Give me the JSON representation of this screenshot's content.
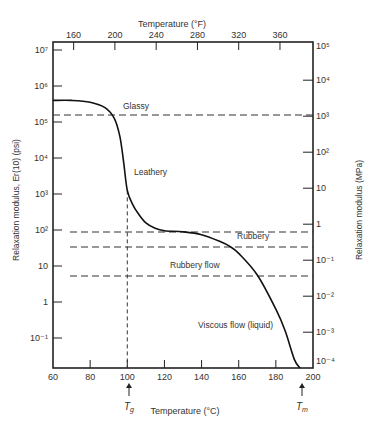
{
  "chart_data": {
    "type": "line",
    "title": "",
    "xlabel": "Temperature (°C)",
    "x2label": "Temperature (°F)",
    "ylabel": "Relaxation modulus, Er(10) (psi)",
    "y2label": "Relaxation modulus (MPa)",
    "xlim": [
      60,
      200
    ],
    "ylim_log10_psi": [
      -1.9,
      7.2
    ],
    "x_ticks": [
      "60",
      "80",
      "100",
      "120",
      "140",
      "160",
      "180",
      "200"
    ],
    "x_tick_values": [
      60,
      80,
      100,
      120,
      140,
      160,
      180,
      200
    ],
    "x2_ticks": [
      "160",
      "200",
      "240",
      "280",
      "320",
      "360"
    ],
    "x2_tick_values_F": [
      160,
      200,
      240,
      280,
      320,
      360
    ],
    "y_ticks": [
      "10⁷",
      "10⁶",
      "10⁵",
      "10⁴",
      "10³",
      "10²",
      "10",
      "1",
      "10⁻¹"
    ],
    "y_tick_log10": [
      7,
      6,
      5,
      4,
      3,
      2,
      1,
      0,
      -1
    ],
    "y2_ticks": [
      "10⁵",
      "10⁴",
      "10³",
      "10²",
      "10",
      "1",
      "10⁻¹",
      "10⁻²",
      "10⁻³",
      "10⁻⁴"
    ],
    "y2_tick_log10_MPa": [
      5,
      4,
      3,
      2,
      1,
      0,
      -1,
      -2,
      -3,
      -4
    ],
    "series": [
      {
        "name": "Relaxation modulus",
        "x": [
          60,
          70,
          80,
          88,
          93,
          96,
          98,
          100,
          103,
          106,
          110,
          115,
          120,
          130,
          140,
          150,
          155,
          160,
          170,
          180,
          185,
          190,
          193
        ],
        "log10_psi": [
          5.6,
          5.6,
          5.55,
          5.4,
          5.1,
          4.6,
          3.9,
          3.1,
          2.7,
          2.45,
          2.2,
          2.05,
          1.98,
          1.95,
          1.87,
          1.68,
          1.55,
          1.35,
          0.75,
          -0.2,
          -0.8,
          -1.6,
          -2.2
        ]
      }
    ],
    "reference_lines": [
      {
        "label": "Glassy",
        "log10_psi": 5.2,
        "style": "dashed"
      },
      {
        "label": "Rubbery",
        "log10_psi": 2.0,
        "style": "dashed"
      },
      {
        "label": "Rubbery (lower)",
        "log10_psi": 1.55,
        "style": "dashed"
      },
      {
        "label": "Rubbery flow",
        "log10_psi": 0.7,
        "style": "dashed"
      }
    ],
    "vertical_reference": {
      "x": 100,
      "style": "dashed"
    },
    "annotations": [
      {
        "text": "Glassy",
        "x": 112,
        "log10_psi": 5.45
      },
      {
        "text": "Leathery",
        "x": 107,
        "log10_psi": 3.65
      },
      {
        "text": "Rubbery",
        "x": 160,
        "log10_psi": 2.2
      },
      {
        "text": "Rubbery flow",
        "x": 104,
        "log10_psi": 0.95
      },
      {
        "text": "Viscous flow (liquid)",
        "x": 141,
        "log10_psi": -0.65
      },
      {
        "text": "Tg",
        "x": 100,
        "below_axis": true
      },
      {
        "text": "Tm",
        "x": 193,
        "below_axis": true
      }
    ],
    "grid": false,
    "legend": "none"
  },
  "labels": {
    "top_axis_title": "Temperature (°F)",
    "bottom_axis_title": "Temperature (°C)",
    "left_axis_title": "Relaxation modulus, Er(10) (psi)",
    "right_axis_title": "Relaxation modulus (MPa)",
    "glassy": "Glassy",
    "leathery": "Leathery",
    "rubbery": "Rubbery",
    "rubbery_flow": "Rubbery flow",
    "viscous_flow": "Viscous flow (liquid)",
    "tg": "T",
    "tg_sub": "g",
    "tm": "T",
    "tm_sub": "m"
  }
}
